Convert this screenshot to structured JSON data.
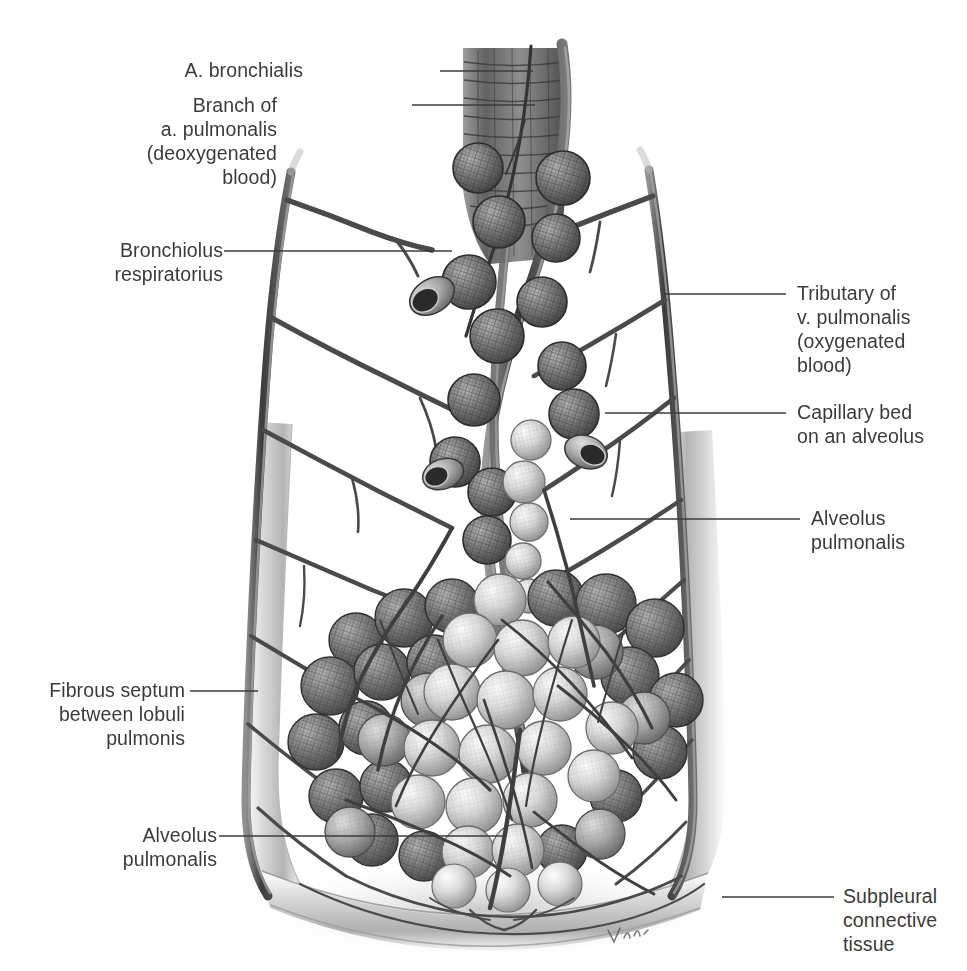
{
  "figure": {
    "signature": "Voll",
    "text_color": "#3b3b3b",
    "background_color": "#ffffff",
    "ink_color": "#4a4a4a",
    "septum_color": "#c9c9c9"
  },
  "labels": [
    {
      "id": "a-bronchialis",
      "text": "A. bronchialis",
      "side": "left",
      "x": 303,
      "y": 58,
      "leader": {
        "x1": 440,
        "y1": 71,
        "x2": 533,
        "y2": 71
      }
    },
    {
      "id": "branch-a-pulmonalis",
      "text": "Branch of\na. pulmonalis\n(deoxygenated\nblood)",
      "side": "left",
      "x": 277,
      "y": 93,
      "leader": {
        "x1": 412,
        "y1": 105,
        "x2": 535,
        "y2": 105
      }
    },
    {
      "id": "bronchiolus-respiratorius",
      "text": "Bronchiolus\nrespiratorius",
      "side": "left",
      "x": 107,
      "y": 238,
      "leader": {
        "x1": 224,
        "y1": 251,
        "x2": 452,
        "y2": 251
      }
    },
    {
      "id": "tributary-v-pulmonalis",
      "text": "Tributary of\nv. pulmonalis\n(oxygenated\nblood)",
      "side": "right",
      "x": 797,
      "y": 281,
      "leader": {
        "x1": 663,
        "y1": 294,
        "x2": 786,
        "y2": 294
      }
    },
    {
      "id": "capillary-bed",
      "text": "Capillary bed\non an alveolus",
      "side": "right",
      "x": 797,
      "y": 400,
      "leader": {
        "x1": 605,
        "y1": 413,
        "x2": 786,
        "y2": 413
      }
    },
    {
      "id": "alveolus-pulmonalis-upper",
      "text": "Alveolus\npulmonalis",
      "side": "right",
      "x": 811,
      "y": 506,
      "leader": {
        "x1": 570,
        "y1": 519,
        "x2": 800,
        "y2": 519
      }
    },
    {
      "id": "fibrous-septum",
      "text": "Fibrous septum\nbetween lobuli\npulmonis",
      "side": "left",
      "x": 37,
      "y": 678,
      "leader": {
        "x1": 190,
        "y1": 691,
        "x2": 258,
        "y2": 691
      }
    },
    {
      "id": "alveolus-pulmonalis-lower",
      "text": "Alveolus\npulmonalis",
      "side": "left",
      "x": 100,
      "y": 823,
      "leader": {
        "x1": 219,
        "y1": 836,
        "x2": 505,
        "y2": 836
      }
    },
    {
      "id": "subpleural-connective-tissue",
      "text": "Subpleural\nconnective\ntissue",
      "side": "right",
      "x": 843,
      "y": 884,
      "leader": {
        "x1": 722,
        "y1": 897,
        "x2": 834,
        "y2": 897
      }
    }
  ],
  "structures": [
    {
      "name": "bronchus-trunk",
      "description": "Cartilaginous bronchiole trunk at top center"
    },
    {
      "name": "a-bronchialis-vessel",
      "description": "Thin bronchial artery running along the bronchus"
    },
    {
      "name": "a-pulmonalis-vessel",
      "description": "Thick pulmonary artery branch (deoxygenated blood)"
    },
    {
      "name": "left-interlobular-vein",
      "description": "Large vessel forming the left boundary of the lobule"
    },
    {
      "name": "right-interlobular-vein",
      "description": "Large vessel forming the right boundary of the lobule"
    },
    {
      "name": "alveolar-sac-cluster",
      "description": "Dense grape-like cluster of alveoli in the lower half"
    },
    {
      "name": "alveolar-ducts",
      "description": "Chain of alveoli along the central respiratory bronchiole"
    },
    {
      "name": "fibrous-septum-band",
      "description": "Pale gray connective tissue band bordering the lobule"
    },
    {
      "name": "subpleural-layer",
      "description": "Pale gray layer at the bottom of the lobule"
    }
  ]
}
